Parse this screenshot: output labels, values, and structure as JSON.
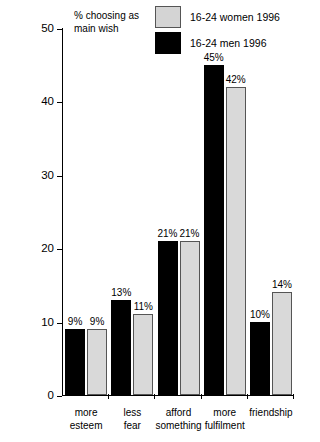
{
  "chart_data": {
    "type": "bar",
    "title": "",
    "ylabel": "% choosing as\nmain wish",
    "xlabel": "",
    "ylim": [
      0,
      50
    ],
    "yticks": [
      0,
      10,
      20,
      30,
      40,
      50
    ],
    "grid": false,
    "legend_position": "top-right",
    "categories": [
      "more\nesteem",
      "less\nfear",
      "afford\nsomething",
      "more\nfulfilment",
      "friendship"
    ],
    "series": [
      {
        "name": "16-24 men 1996",
        "color": "#000000",
        "values": [
          9,
          13,
          21,
          45,
          10
        ],
        "labels": [
          "9%",
          "13%",
          "21%",
          "45%",
          "10%"
        ]
      },
      {
        "name": "16-24 women 1996",
        "color": "#d9d9d9",
        "values": [
          9,
          11,
          21,
          42,
          14
        ],
        "labels": [
          "9%",
          "11%",
          "21%",
          "42%",
          "14%"
        ]
      }
    ]
  },
  "legend": {
    "items": [
      {
        "label": "16-24 women 1996",
        "swatch": "light-gray"
      },
      {
        "label": "16-24 men 1996",
        "swatch": "black"
      }
    ]
  },
  "yaxis": {
    "title": "% choosing as\nmain wish",
    "ticks": [
      "50",
      "40",
      "30",
      "20",
      "10",
      "0"
    ]
  }
}
